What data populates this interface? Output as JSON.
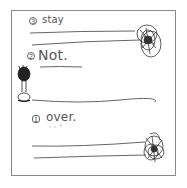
{
  "drawing": {
    "items": [
      {
        "number": "3",
        "word": "stay"
      },
      {
        "number": "2",
        "word": "Not."
      },
      {
        "number": "1",
        "word": "over."
      }
    ],
    "stroke_color": "#555555",
    "scribble_color": "#222222",
    "border_color": "#8a8a8a"
  }
}
